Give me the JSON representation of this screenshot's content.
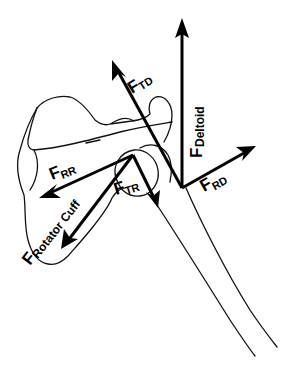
{
  "diagram": {
    "background": "#ffffff",
    "ink_color": "#000000",
    "labels": {
      "deltoid": {
        "main": "F",
        "sub": "Deltoid"
      },
      "f_td": {
        "main": "F",
        "sub": "TD"
      },
      "f_rd": {
        "main": "F",
        "sub": "RD"
      },
      "f_rr": {
        "main": "F",
        "sub": "RR"
      },
      "f_tr": {
        "main": "F",
        "sub": "TR"
      },
      "rotator_cuff": {
        "main": "F",
        "sub": "Rotator Cuff"
      }
    },
    "vectors": [
      {
        "id": "deltoid",
        "from": [
          182,
          188
        ],
        "to": [
          182,
          22
        ]
      },
      {
        "id": "f_td",
        "from": [
          182,
          188
        ],
        "to": [
          113,
          62
        ]
      },
      {
        "id": "f_rd",
        "from": [
          182,
          188
        ],
        "to": [
          255,
          147
        ]
      },
      {
        "id": "rotator_cuff",
        "from": [
          133,
          155
        ],
        "to": [
          62,
          248
        ]
      },
      {
        "id": "f_rr",
        "from": [
          133,
          155
        ],
        "to": [
          40,
          197
        ]
      },
      {
        "id": "f_tr",
        "from": [
          133,
          155
        ],
        "to": [
          157,
          205
        ]
      }
    ]
  }
}
